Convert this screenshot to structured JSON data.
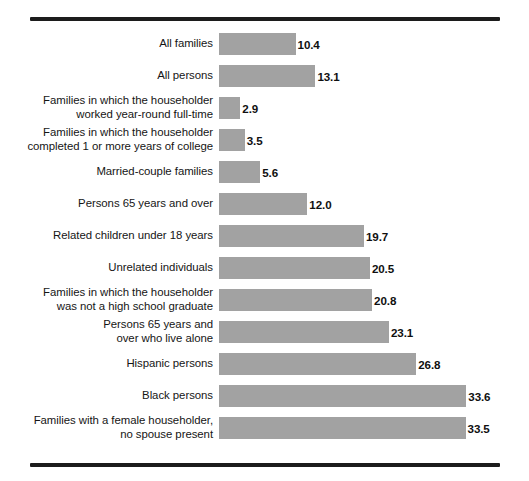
{
  "figure": {
    "background_color": "#ffffff",
    "bar_color": "#a2a2a2",
    "rule_color": "#1c1c1c",
    "text_color": "#151515"
  },
  "chart_data": {
    "type": "bar",
    "orientation": "horizontal",
    "title": "",
    "subtitle": "",
    "xlabel": "",
    "ylabel": "",
    "xlim": [
      0,
      34
    ],
    "grid": false,
    "legend": false,
    "value_labels": true,
    "categories": [
      "All families",
      "All persons",
      "Families in which the householder worked year-round full-time",
      "Families in which the householder completed 1 or more years of college",
      "Married-couple families",
      "Persons 65 years and over",
      "Related children under 18 years",
      "Unrelated individuals",
      "Families in which the householder was not a high school graduate",
      "Persons 65 years and over who live alone",
      "Hispanic persons",
      "Black persons",
      "Families with a female householder, no spouse present"
    ],
    "values": [
      10.4,
      13.1,
      2.9,
      3.5,
      5.6,
      12.0,
      19.7,
      20.5,
      20.8,
      23.1,
      26.8,
      33.6,
      33.5
    ],
    "value_text": [
      "10.4",
      "13.1",
      "2.9",
      "3.5",
      "5.6",
      "12.0",
      "19.7",
      "20.5",
      "20.8",
      "23.1",
      "26.8",
      "33.6",
      "33.5"
    ]
  },
  "rows": [
    {
      "label_lines": [
        "All families"
      ],
      "value": 10.4,
      "value_text": "10.4"
    },
    {
      "label_lines": [
        "All persons"
      ],
      "value": 13.1,
      "value_text": "13.1"
    },
    {
      "label_lines": [
        "Families in which the householder",
        "worked year-round full-time"
      ],
      "value": 2.9,
      "value_text": "2.9"
    },
    {
      "label_lines": [
        "Families in which the householder",
        "completed 1 or more years of college"
      ],
      "value": 3.5,
      "value_text": "3.5"
    },
    {
      "label_lines": [
        "Married-couple families"
      ],
      "value": 5.6,
      "value_text": "5.6"
    },
    {
      "label_lines": [
        "Persons 65 years and over"
      ],
      "value": 12.0,
      "value_text": "12.0"
    },
    {
      "label_lines": [
        "Related children under 18 years"
      ],
      "value": 19.7,
      "value_text": "19.7"
    },
    {
      "label_lines": [
        "Unrelated individuals"
      ],
      "value": 20.5,
      "value_text": "20.5"
    },
    {
      "label_lines": [
        "Families in which the householder",
        "was not a high school graduate"
      ],
      "value": 20.8,
      "value_text": "20.8"
    },
    {
      "label_lines": [
        "Persons 65 years and",
        "over who live alone"
      ],
      "value": 23.1,
      "value_text": "23.1"
    },
    {
      "label_lines": [
        "Hispanic persons"
      ],
      "value": 26.8,
      "value_text": "26.8"
    },
    {
      "label_lines": [
        "Black persons"
      ],
      "value": 33.6,
      "value_text": "33.6"
    },
    {
      "label_lines": [
        "Families with a female householder,",
        "no spouse present"
      ],
      "value": 33.5,
      "value_text": "33.5"
    }
  ]
}
